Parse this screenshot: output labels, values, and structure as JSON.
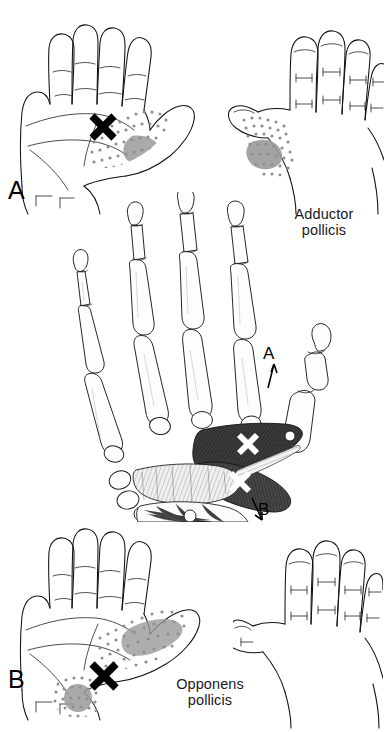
{
  "figure": {
    "type": "anatomical-illustration",
    "background_color": "#ffffff",
    "ink_color": "#111111",
    "muscle_fill": "#3a3a3c",
    "stipple_color": "#8e8e8e",
    "trigger_point_marker": "X"
  },
  "panels": {
    "a": {
      "letter": "A",
      "label_line1": "Adductor",
      "label_line2": "pollicis",
      "palmar_view_name": "palmar-hand-referred-pain",
      "dorsal_view_name": "dorsal-hand-referred-pain",
      "marker": "X"
    },
    "b": {
      "letter": "B",
      "label_line1": "Opponens",
      "label_line2": "pollicis",
      "palmar_view_name": "palmar-hand-referred-pain",
      "dorsal_view_name": "dorsal-hand-outline",
      "marker": "X"
    }
  },
  "center_diagram": {
    "name": "skeletal-hand-with-thumb-muscles",
    "marker": "X",
    "callouts": [
      {
        "letter": "A",
        "arrow": "up",
        "muscle": "Adductor pollicis"
      },
      {
        "letter": "B",
        "arrow": "down",
        "muscle": "Opponens pollicis"
      }
    ]
  }
}
